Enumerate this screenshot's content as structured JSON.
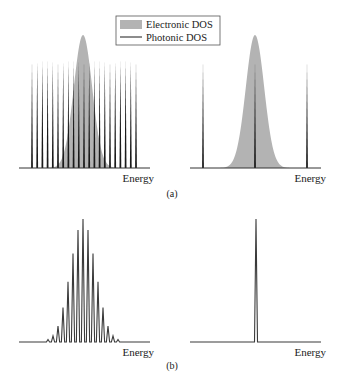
{
  "figure": {
    "panel_a_label": "(a)",
    "panel_b_label": "(b)",
    "axis_label": "Energy"
  },
  "legend": {
    "items": [
      {
        "label": "Electronic DOS",
        "style": "filled-gray",
        "color": "#b3b3b3"
      },
      {
        "label": "Photonic DOS",
        "style": "line",
        "color": "#1a1a1a"
      }
    ]
  },
  "colors": {
    "electronic": "#b3b3b3",
    "photonic": "#1a1a1a",
    "axis": "#333333",
    "peaks": "#3a3a3a"
  },
  "chart_data": [
    {
      "id": "a-left",
      "type": "line",
      "title": "",
      "xlabel": "Energy",
      "ylabel": "",
      "description": "Dense comb of photonic modes (short cavity-free case) overlapping a Gaussian electronic DOS",
      "electronic_dos": {
        "shape": "gaussian",
        "center": 0.5,
        "sigma": 0.09,
        "peak": 1.0
      },
      "photonic_modes": {
        "count": 21,
        "x_start": 0.1,
        "x_end": 0.9,
        "height": 0.82
      },
      "grid": false
    },
    {
      "id": "a-right",
      "type": "line",
      "title": "",
      "xlabel": "Energy",
      "ylabel": "",
      "description": "Sparse photonic modes; only one mode lies within the Gaussian electronic DOS",
      "electronic_dos": {
        "shape": "gaussian",
        "center": 0.5,
        "sigma": 0.09,
        "peak": 1.0
      },
      "photonic_modes": {
        "count": 3,
        "x": [
          0.1,
          0.5,
          0.9
        ],
        "height": 0.82
      },
      "grid": false
    },
    {
      "id": "b-left",
      "type": "line",
      "title": "",
      "xlabel": "Energy",
      "ylabel": "",
      "description": "Multimode emission spectrum: comb peaks modulated by Gaussian envelope",
      "peaks": {
        "x": [
          48,
          53,
          58,
          63,
          68,
          73,
          78,
          83,
          88,
          93,
          98,
          103,
          108,
          113,
          118
        ],
        "relative_height": [
          0.02,
          0.05,
          0.13,
          0.28,
          0.49,
          0.72,
          0.91,
          1.0,
          0.91,
          0.72,
          0.49,
          0.28,
          0.13,
          0.05,
          0.02
        ]
      },
      "grid": false
    },
    {
      "id": "b-right",
      "type": "line",
      "title": "",
      "xlabel": "Energy",
      "ylabel": "",
      "description": "Single-mode emission: one narrow peak",
      "peaks": {
        "x": [
          256
        ],
        "relative_height": [
          1.0
        ]
      },
      "grid": false
    }
  ]
}
